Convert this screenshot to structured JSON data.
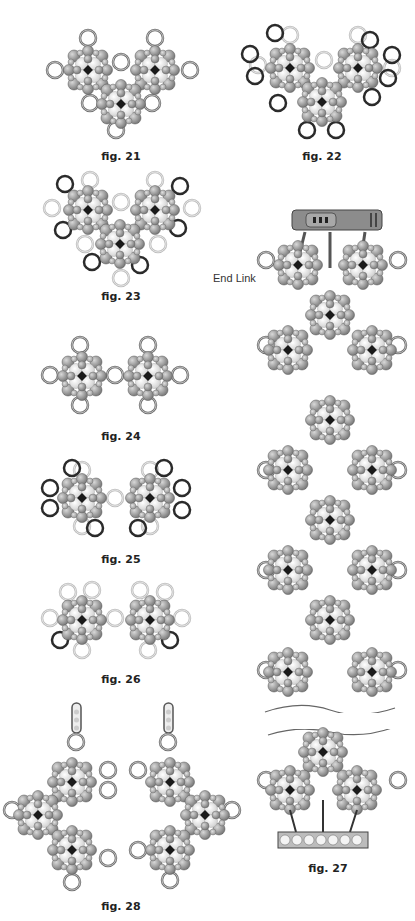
{
  "figures": [
    {
      "id": "fig21",
      "caption": "fig. 21",
      "cx": 121,
      "cy": 127
    },
    {
      "id": "fig22",
      "caption": "fig. 22",
      "cx": 320,
      "cy": 127
    },
    {
      "id": "fig23",
      "caption": "fig. 23",
      "cx": 121,
      "cy": 297
    },
    {
      "id": "fig24",
      "caption": "fig. 24",
      "cx": 121,
      "cy": 437
    },
    {
      "id": "fig25",
      "caption": "fig. 25",
      "cx": 121,
      "cy": 560
    },
    {
      "id": "fig26",
      "caption": "fig. 26",
      "cx": 121,
      "cy": 680
    },
    {
      "id": "fig27",
      "caption": "fig. 27",
      "cx": 330,
      "cy": 870
    },
    {
      "id": "fig28",
      "caption": "fig. 28",
      "cx": 121,
      "cy": 906
    }
  ],
  "labels": {
    "end_link": "End Link"
  },
  "colors": {
    "bead_dark": "#8a8a8a",
    "bead_light": "#f2f2f2",
    "ring_grey": "#777777",
    "ring_light": "#c8c8c8",
    "ring_dark": "#333333",
    "center": "#1a1a1a"
  }
}
